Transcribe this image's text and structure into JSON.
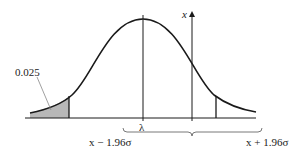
{
  "diagram": {
    "type": "normal-distribution-confidence-interval",
    "labels": {
      "tail_area": "0.025",
      "mean": "λ",
      "observed": "x",
      "lower_bound": "x − 1.96σ",
      "upper_bound": "x + 1.96σ"
    },
    "colors": {
      "stroke": "#1a1a1a",
      "shaded_tail": "#b8b8b8",
      "leader_line": "#888888"
    }
  }
}
